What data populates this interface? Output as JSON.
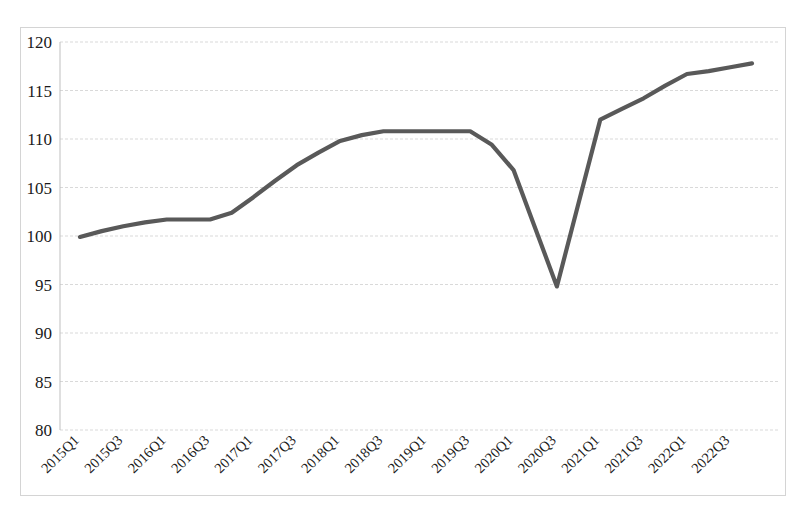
{
  "chart_data": {
    "type": "line",
    "title": "",
    "subtitle": "",
    "xlabel": "",
    "ylabel": "",
    "ylim": [
      80,
      120
    ],
    "ytick_step": 5,
    "yticks": [
      120,
      115,
      110,
      105,
      100,
      95,
      90,
      85,
      80
    ],
    "grid": true,
    "grid_axis": "y",
    "legend": false,
    "legend_position": "none",
    "annotations": [],
    "line_color": "#595959",
    "x": [
      "2015Q1",
      "2015Q2",
      "2015Q3",
      "2015Q4",
      "2016Q1",
      "2016Q2",
      "2016Q3",
      "2016Q4",
      "2017Q1",
      "2017Q2",
      "2017Q3",
      "2017Q4",
      "2018Q1",
      "2018Q2",
      "2018Q3",
      "2018Q4",
      "2019Q1",
      "2019Q2",
      "2019Q3",
      "2019Q4",
      "2020Q1",
      "2020Q2",
      "2020Q3",
      "2020Q4",
      "2021Q1",
      "2021Q2",
      "2021Q3",
      "2021Q4",
      "2022Q1",
      "2022Q2",
      "2022Q3",
      "2022Q4"
    ],
    "xtick_labels": [
      "2015Q1",
      "2015Q3",
      "2016Q1",
      "2016Q3",
      "2017Q1",
      "2017Q3",
      "2018Q1",
      "2018Q3",
      "2019Q1",
      "2019Q3",
      "2020Q1",
      "2020Q3",
      "2021Q1",
      "2021Q3",
      "2022Q1",
      "2022Q3"
    ],
    "xtick_rotation_deg": 45,
    "series": [
      {
        "name": "index",
        "color": "#595959",
        "values": [
          99.9,
          100.5,
          101.0,
          101.4,
          101.7,
          101.7,
          101.7,
          102.4,
          104.0,
          105.7,
          107.3,
          108.6,
          109.8,
          110.4,
          110.8,
          110.8,
          110.8,
          110.8,
          110.8,
          109.4,
          106.8,
          100.8,
          94.8,
          103.4,
          112.0,
          113.1,
          114.2,
          115.5,
          116.7,
          117.0,
          117.4,
          117.8
        ]
      }
    ]
  },
  "plot": {
    "x_min_px": 80,
    "x_max_px": 752,
    "y_top_value": 120,
    "y_bottom_value": 80,
    "y_top_px": 42,
    "y_bottom_px": 430,
    "frame": {
      "left": 20.5,
      "top": 27.5,
      "right": 785.5,
      "bottom": 495.5
    }
  }
}
